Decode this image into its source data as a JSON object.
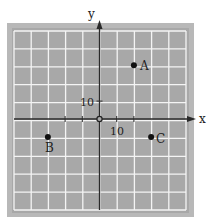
{
  "chart_data": {
    "type": "scatter",
    "title": "",
    "xlabel": "x",
    "ylabel": "y",
    "grid": true,
    "grid_step": 10,
    "xlim": [
      -50,
      50
    ],
    "ylim": [
      -50,
      50
    ],
    "tick_labels": {
      "x": "10",
      "y": "10"
    },
    "points": [
      {
        "label": "A",
        "x": 20,
        "y": 30
      },
      {
        "label": "B",
        "x": -30,
        "y": -10
      },
      {
        "label": "C",
        "x": 30,
        "y": -10
      }
    ],
    "colors": {
      "background": "#a8a8a8",
      "frame": "#b8b8b8",
      "grid": "#f4f4f4",
      "axis": "#2a2a2a",
      "point": "#111111"
    }
  }
}
